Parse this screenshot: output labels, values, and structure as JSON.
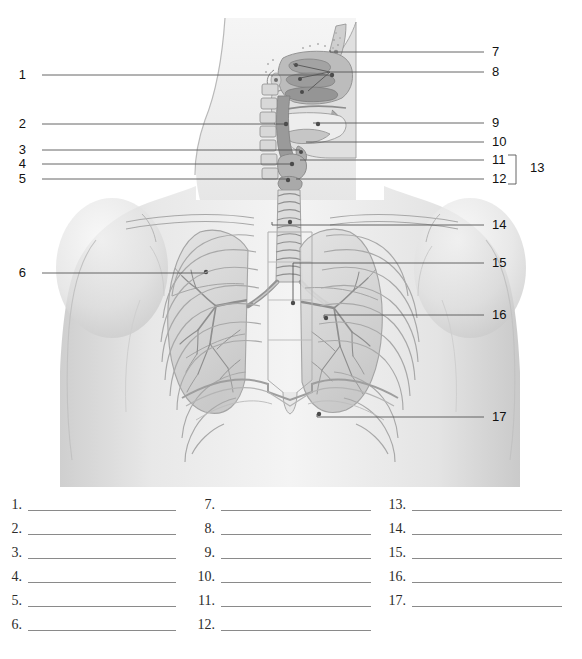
{
  "figure": {
    "type": "anatomy-labeling-worksheet",
    "views": [
      "midsagittal head and neck section",
      "anterior thorax with lungs"
    ],
    "total_leader_labels": 17,
    "palette": {
      "background": "#ffffff",
      "ink": "#111111",
      "leader_line": "#555555",
      "blank_line": "#8a8a8a",
      "skin_light": "#f2f2f2",
      "skin_mid": "#dcdcdc",
      "skin_shadow": "#bdbdbd",
      "cavity_dark": "#8e8e8e",
      "tissue_mid": "#b5b5b5",
      "outline": "#9a9a9a"
    }
  },
  "leaders": {
    "left": [
      {
        "id": "1",
        "label": "1",
        "num_x": 26,
        "num_y": 68,
        "line_x1": 42,
        "line_x2": 332,
        "line_y": 75,
        "tip_x": 332,
        "tip_y": 75
      },
      {
        "id": "2",
        "label": "2",
        "num_x": 26,
        "num_y": 117,
        "line_x1": 42,
        "line_x2": 288,
        "line_y": 124,
        "tip_x": 288,
        "tip_y": 124
      },
      {
        "id": "3",
        "label": "3",
        "num_x": 26,
        "num_y": 143,
        "line_x1": 42,
        "line_x2": 300,
        "line_y": 150,
        "tip_x": 300,
        "tip_y": 150
      },
      {
        "id": "4",
        "label": "4",
        "num_x": 26,
        "num_y": 157,
        "line_x1": 42,
        "line_x2": 290,
        "line_y": 164,
        "tip_x": 290,
        "tip_y": 164
      },
      {
        "id": "5",
        "label": "5",
        "num_x": 26,
        "num_y": 172,
        "line_x1": 42,
        "line_x2": 286,
        "line_y": 179,
        "tip_x": 286,
        "tip_y": 179
      },
      {
        "id": "6",
        "label": "6",
        "num_x": 26,
        "num_y": 266,
        "line_x1": 42,
        "line_x2": 205,
        "line_y": 273,
        "tip_x": 205,
        "tip_y": 273
      }
    ],
    "right": [
      {
        "id": "7",
        "label": "7",
        "num_x": 492,
        "num_y": 45,
        "line_x1": 330,
        "line_x2": 484,
        "line_y": 52,
        "tip_x": 330,
        "tip_y": 50
      },
      {
        "id": "8",
        "label": "8",
        "num_x": 492,
        "num_y": 65,
        "line_x1": 293,
        "line_x2": 484,
        "line_y": 72,
        "tip_x": 293,
        "tip_y": 64
      },
      {
        "id": "9",
        "label": "9",
        "num_x": 492,
        "num_y": 116,
        "line_x1": 313,
        "line_x2": 484,
        "line_y": 123,
        "tip_x": 313,
        "tip_y": 123
      },
      {
        "id": "10",
        "label": "10",
        "num_x": 492,
        "num_y": 135,
        "line_x1": 306,
        "line_x2": 484,
        "line_y": 142,
        "tip_x": 306,
        "tip_y": 142
      },
      {
        "id": "11",
        "label": "11",
        "num_x": 492,
        "num_y": 153,
        "line_x1": 300,
        "line_x2": 484,
        "line_y": 160,
        "tip_x": 300,
        "tip_y": 160
      },
      {
        "id": "12",
        "label": "12",
        "num_x": 492,
        "num_y": 172,
        "line_x1": 296,
        "line_x2": 484,
        "line_y": 179,
        "tip_x": 296,
        "tip_y": 179
      },
      {
        "id": "13",
        "label": "13",
        "num_x": 530,
        "num_y": 161,
        "bracket": true,
        "bracket_x": 516,
        "bracket_top": 155,
        "bracket_bottom": 184
      },
      {
        "id": "14",
        "label": "14",
        "num_x": 492,
        "num_y": 218,
        "line_x1": 272,
        "line_x2": 484,
        "line_y": 225,
        "tip_x": 272,
        "tip_y": 222
      },
      {
        "id": "15",
        "label": "15",
        "num_x": 492,
        "num_y": 256,
        "line_x1": 293,
        "line_x2": 484,
        "line_y": 263,
        "tip_x": 293,
        "tip_y": 303
      },
      {
        "id": "16",
        "label": "16",
        "num_x": 492,
        "num_y": 308,
        "line_x1": 324,
        "line_x2": 484,
        "line_y": 315,
        "tip_x": 324,
        "tip_y": 318
      },
      {
        "id": "17",
        "label": "17",
        "num_x": 492,
        "num_y": 410,
        "line_x1": 317,
        "line_x2": 484,
        "line_y": 417,
        "tip_x": 317,
        "tip_y": 414
      }
    ],
    "fan_8": [
      {
        "tip_x": 293,
        "tip_y": 64
      },
      {
        "tip_x": 300,
        "tip_y": 78
      },
      {
        "tip_x": 308,
        "tip_y": 91
      }
    ]
  },
  "answer_blanks": {
    "columns": [
      {
        "column_index": 1,
        "num_right_x": 22,
        "line_x": 25,
        "line_width": 148,
        "items": [
          {
            "number": "1.",
            "y": 8,
            "value": ""
          },
          {
            "number": "2.",
            "y": 32,
            "value": ""
          },
          {
            "number": "3.",
            "y": 56,
            "value": ""
          },
          {
            "number": "4.",
            "y": 80,
            "value": ""
          },
          {
            "number": "5.",
            "y": 104,
            "value": ""
          },
          {
            "number": "6.",
            "y": 128,
            "value": ""
          }
        ]
      },
      {
        "column_index": 2,
        "num_right_x": 215,
        "line_x": 218,
        "line_width": 150,
        "items": [
          {
            "number": "7.",
            "y": 8,
            "value": ""
          },
          {
            "number": "8.",
            "y": 32,
            "value": ""
          },
          {
            "number": "9.",
            "y": 56,
            "value": ""
          },
          {
            "number": "10.",
            "y": 80,
            "value": ""
          },
          {
            "number": "11.",
            "y": 104,
            "value": ""
          },
          {
            "number": "12.",
            "y": 128,
            "value": ""
          }
        ]
      },
      {
        "column_index": 3,
        "num_right_x": 406,
        "line_x": 409,
        "line_width": 150,
        "items": [
          {
            "number": "13.",
            "y": 8,
            "value": ""
          },
          {
            "number": "14.",
            "y": 32,
            "value": ""
          },
          {
            "number": "15.",
            "y": 56,
            "value": ""
          },
          {
            "number": "16.",
            "y": 80,
            "value": ""
          },
          {
            "number": "17.",
            "y": 104,
            "value": ""
          }
        ]
      }
    ]
  }
}
